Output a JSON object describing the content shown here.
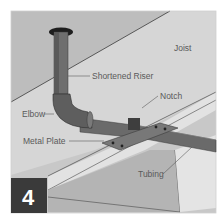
{
  "figure": {
    "step_number": "4",
    "labels": {
      "joist": "Joist",
      "shortened_riser": "Shortened Riser",
      "notch": "Notch",
      "elbow": "Elbow",
      "metal_plate": "Metal Plate",
      "tubing": "Tubing"
    },
    "colors": {
      "background": "#c8c8c8",
      "joist_face": "#d2d2d2",
      "joist_underside": "#e6e6e6",
      "pipe": "#6e6e6e",
      "pipe_dark": "#4a4a4a",
      "plate": "#7a7a7a",
      "step_badge": "#3a3a3a",
      "label_text": "#5a5a5a"
    }
  }
}
